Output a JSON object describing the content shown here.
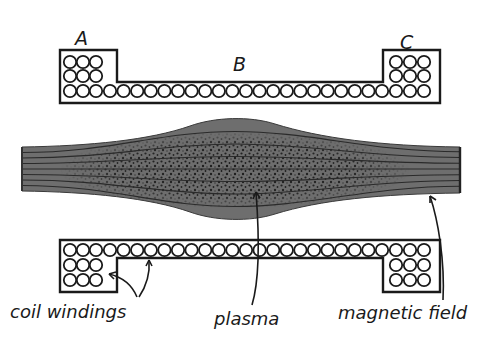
{
  "diagram": {
    "colors": {
      "ink": "#1a1a1a",
      "plasma_fill": "#6e6e6e",
      "plasma_dense": "#111111",
      "field_line": "#2a2a2a",
      "background": "#ffffff"
    },
    "coil_labels": {
      "a": "A",
      "b": "B",
      "c": "C"
    },
    "callouts": {
      "coil_windings": "coil windings",
      "plasma": "plasma",
      "magnetic_field": "magnetic field"
    },
    "coils": {
      "top": {
        "left_block": {
          "rows": 3,
          "cols": 3
        },
        "right_block": {
          "rows": 3,
          "cols": 3
        },
        "middle_row_count": 21
      },
      "bottom": {
        "left_block": {
          "rows": 3,
          "cols": 3
        },
        "right_block": {
          "rows": 3,
          "cols": 3
        },
        "middle_row_count": 21
      }
    },
    "field_line_count": 7
  }
}
